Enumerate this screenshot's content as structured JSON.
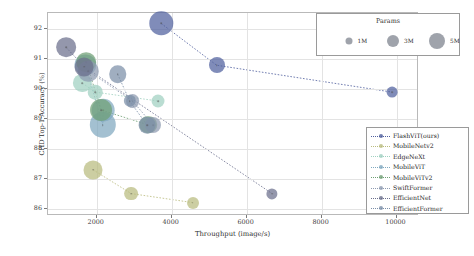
{
  "chart_data": {
    "type": "scatter",
    "title": "",
    "xlabel": "Throughput (image/s)",
    "ylabel": "CHD Top-1 Accuracy (%)",
    "xlim": [
      700,
      10600
    ],
    "ylim": [
      85.75,
      92.55
    ],
    "xticks": [
      "2000",
      "4000",
      "6000",
      "8000",
      "10000"
    ],
    "xtick_values": [
      2000,
      4000,
      6000,
      8000,
      10000
    ],
    "yticks": [
      "86",
      "87",
      "88",
      "89",
      "90",
      "91",
      "92"
    ],
    "ytick_values": [
      86,
      87,
      88,
      89,
      90,
      91,
      92
    ],
    "grid": true,
    "legend_position": "lower right",
    "size_encoding": "Params",
    "series": [
      {
        "name": "FlashViT(ours)",
        "color": "#4f5f9e",
        "points": [
          {
            "x": 3720,
            "y": 92.2,
            "params": 4.6
          },
          {
            "x": 5200,
            "y": 90.8,
            "params": 2.6
          },
          {
            "x": 9880,
            "y": 89.9,
            "params": 1.2
          }
        ]
      },
      {
        "name": "MobileNetv2",
        "color": "#b9bb7e",
        "points": [
          {
            "x": 1900,
            "y": 87.3,
            "params": 3.4
          },
          {
            "x": 2920,
            "y": 86.5,
            "params": 2.0
          },
          {
            "x": 4560,
            "y": 86.2,
            "params": 1.5
          }
        ]
      },
      {
        "name": "EdgeNeXt",
        "color": "#9fd0c0",
        "points": [
          {
            "x": 1620,
            "y": 90.2,
            "params": 3.2
          },
          {
            "x": 1960,
            "y": 89.9,
            "params": 2.2
          },
          {
            "x": 3640,
            "y": 89.6,
            "params": 1.8
          }
        ]
      },
      {
        "name": "MobileViT",
        "color": "#7fa8bf",
        "points": [
          {
            "x": 1700,
            "y": 90.8,
            "params": 4.0
          },
          {
            "x": 2180,
            "y": 89.3,
            "params": 4.4
          },
          {
            "x": 2160,
            "y": 88.8,
            "params": 5.4
          }
        ]
      },
      {
        "name": "MobileViTv2",
        "color": "#6f9f74",
        "points": [
          {
            "x": 1720,
            "y": 90.9,
            "params": 3.6
          },
          {
            "x": 2120,
            "y": 89.3,
            "params": 4.2
          },
          {
            "x": 3380,
            "y": 88.8,
            "params": 3.0
          }
        ]
      },
      {
        "name": "SwiftFormer",
        "color": "#8d9ab0",
        "points": [
          {
            "x": 1780,
            "y": 90.6,
            "params": 3.8
          },
          {
            "x": 2960,
            "y": 89.6,
            "params": 2.0
          },
          {
            "x": 3500,
            "y": 88.8,
            "params": 2.6
          }
        ]
      },
      {
        "name": "EfficientNet",
        "color": "#6b6f8c",
        "points": [
          {
            "x": 1180,
            "y": 91.4,
            "params": 3.6
          },
          {
            "x": 1670,
            "y": 90.75,
            "params": 3.4
          },
          {
            "x": 6680,
            "y": 86.5,
            "params": 1.3
          }
        ]
      },
      {
        "name": "EfficientFormer",
        "color": "#7b8fa8",
        "points": [
          {
            "x": 2560,
            "y": 90.5,
            "params": 3.0
          },
          {
            "x": 3340,
            "y": 88.8,
            "params": 2.8
          },
          {
            "x": 2880,
            "y": 89.6,
            "params": 1.6
          }
        ]
      }
    ]
  },
  "params_legend": {
    "title": "Params",
    "items": [
      {
        "label": "1M",
        "size": 7
      },
      {
        "label": "3M",
        "size": 12
      },
      {
        "label": "5M",
        "size": 16
      }
    ]
  },
  "series_legend": {
    "entries": [
      {
        "label": "FlashViT(ours)"
      },
      {
        "label": "MobileNetv2"
      },
      {
        "label": "EdgeNeXt"
      },
      {
        "label": "MobileViT"
      },
      {
        "label": "MobileViTv2"
      },
      {
        "label": "SwiftFormer"
      },
      {
        "label": "EfficientNet"
      },
      {
        "label": "EfficientFormer"
      }
    ]
  }
}
